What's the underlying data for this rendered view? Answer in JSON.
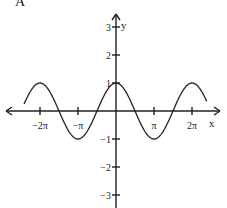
{
  "panel_label": "A",
  "axes": {
    "x_label": "x",
    "y_label": "y",
    "x_ticks": [
      {
        "value": -6.2832,
        "label": "−2π"
      },
      {
        "value": -3.1416,
        "label": "−π"
      },
      {
        "value": 3.1416,
        "label": "π"
      },
      {
        "value": 6.2832,
        "label": "2π"
      }
    ],
    "y_ticks": [
      {
        "value": 3,
        "label": "3"
      },
      {
        "value": 2,
        "label": "2"
      },
      {
        "value": 1,
        "label": "1"
      },
      {
        "value": -1,
        "label": "−1"
      },
      {
        "value": -2,
        "label": "−2"
      },
      {
        "value": -3,
        "label": "−3"
      }
    ]
  },
  "chart_data": {
    "type": "line",
    "title": "A",
    "xlabel": "x",
    "ylabel": "y",
    "function": "y = cos(x)",
    "xlim": [
      -7.6,
      7.6
    ],
    "ylim": [
      -3.3,
      3.3
    ],
    "grid": false,
    "x_tick_labels": [
      "−2π",
      "−π",
      "π",
      "2π"
    ],
    "y_tick_labels": [
      "3",
      "2",
      "1",
      "−1",
      "−2",
      "−3"
    ],
    "series": [
      {
        "name": "cos(x)",
        "x": [
          -7.6,
          -6.2832,
          -4.7124,
          -3.1416,
          -1.5708,
          0,
          1.5708,
          3.1416,
          4.7124,
          6.2832,
          7.5
        ],
        "y": [
          0.25,
          1,
          0,
          -1,
          0,
          1,
          0,
          -1,
          0,
          1,
          0.35
        ]
      }
    ],
    "colors": {
      "curve": "#222222",
      "axes": "#222222"
    }
  }
}
